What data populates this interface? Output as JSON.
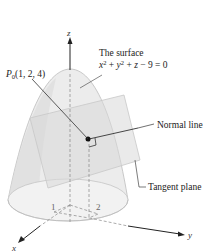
{
  "diagram": {
    "surface_label_line1": "The surface",
    "surface_equation": {
      "x": "x",
      "x_exp": "2",
      "plus1": " + ",
      "y": "y",
      "y_exp": "2",
      "plus2": " + ",
      "z": "z",
      "rest": " − 9 = 0"
    },
    "point_label": {
      "P": "P",
      "sub": "0",
      "coords": "(1, 2, 4)"
    },
    "normal_line_label": "Normal line",
    "tangent_plane_label": "Tangent plane",
    "axes": {
      "x": "x",
      "y": "y",
      "z": "z"
    },
    "ticks": {
      "x_tick": "1",
      "y_tick": "2"
    },
    "colors": {
      "surface_fill": "#e6e6e6",
      "plane_fill": "#dcdcdc",
      "line": "#333333",
      "point": "#111111"
    }
  }
}
